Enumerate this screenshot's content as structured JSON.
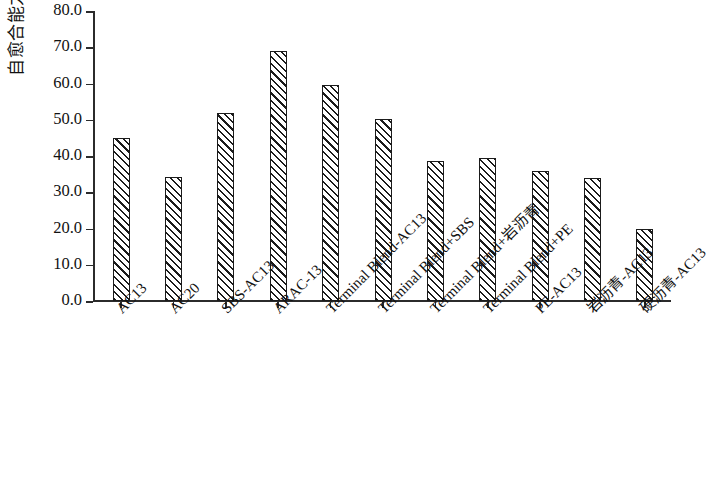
{
  "chart_data": {
    "type": "bar",
    "title": "",
    "subtitle": "",
    "xlabel": "",
    "ylabel": "自愈合能力/%",
    "ylim": [
      0.0,
      80.0
    ],
    "ytick_step": 10.0,
    "ytick_labels": [
      "80.0",
      "70.0",
      "60.0",
      "50.0",
      "40.0",
      "30.0",
      "20.0",
      "10.0",
      "0.0"
    ],
    "ytick_values": [
      80.0,
      70.0,
      60.0,
      50.0,
      40.0,
      30.0,
      20.0,
      10.0,
      0.0
    ],
    "grid": false,
    "legend": null,
    "legend_position": "none",
    "bar_fill": "diagonal-hatch",
    "bar_edge_color": "#1b1b1b",
    "bar_face_color": "#ffffff",
    "categories": [
      "AC13",
      "AC20",
      "SBS-AC13",
      "ARAC-13",
      "Terminal Blend-AC13",
      "Terminal Blend+SBS",
      "Terminal Blend+岩沥青",
      "Terminal Blend+PE",
      "PE-AC13",
      "岩沥青-AC13",
      "硬沥青-AC13"
    ],
    "values": [
      45.0,
      34.3,
      51.8,
      69.0,
      59.5,
      50.2,
      38.7,
      39.4,
      36.0,
      34.0,
      20.0
    ]
  }
}
